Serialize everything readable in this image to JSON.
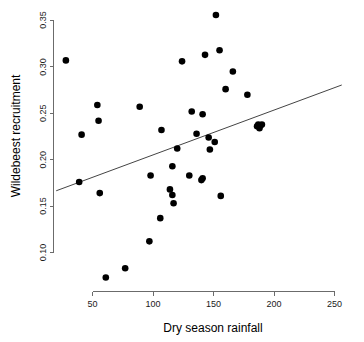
{
  "chart_data": {
    "type": "scatter",
    "title": "",
    "xlabel": "Dry season rainfall",
    "ylabel": "Wildebeest recruitment",
    "xlim": [
      20,
      260
    ],
    "ylim": [
      0.06,
      0.36
    ],
    "xticks": [
      50,
      100,
      150,
      200,
      250
    ],
    "xticklabels": [
      "50",
      "100",
      "150",
      "200",
      "250"
    ],
    "yticks": [
      0.1,
      0.15,
      0.2,
      0.25,
      0.3,
      0.35
    ],
    "yticklabels": [
      "0.10",
      "0.15",
      "0.20",
      "0.25",
      "0.30",
      "0.35"
    ],
    "grid": false,
    "legend": false,
    "marker": "filled-circle",
    "marker_color": "#000000",
    "series": [
      {
        "name": "Wildebeest recruitment vs dry season rainfall",
        "x": [
          28,
          39,
          41,
          54,
          55,
          56,
          61,
          77,
          89,
          97,
          98,
          106,
          107,
          114,
          116,
          116,
          117,
          120,
          124,
          130,
          132,
          136,
          140,
          141,
          141,
          143,
          146,
          147,
          151,
          152,
          155,
          156,
          160,
          166,
          178,
          186,
          187,
          188,
          189,
          190
        ],
        "y": [
          0.307,
          0.176,
          0.227,
          0.259,
          0.242,
          0.164,
          0.073,
          0.083,
          0.257,
          0.112,
          0.183,
          0.137,
          0.232,
          0.168,
          0.193,
          0.162,
          0.153,
          0.212,
          0.306,
          0.183,
          0.252,
          0.228,
          0.178,
          0.249,
          0.18,
          0.313,
          0.224,
          0.211,
          0.219,
          0.356,
          0.318,
          0.161,
          0.276,
          0.295,
          0.27,
          0.236,
          0.238,
          0.234,
          0.237,
          0.238
        ]
      }
    ],
    "trendline": {
      "type": "linear-fit",
      "x_start": 20,
      "y_start": 0.1665,
      "x_end": 256,
      "y_end": 0.2805,
      "color": "#444444"
    }
  }
}
